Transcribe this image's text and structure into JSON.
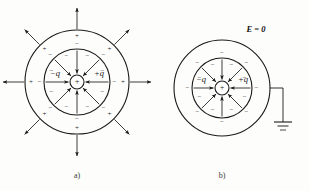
{
  "figure": {
    "background_color": "#fdfdfc",
    "ink_color": "#1a1a1a",
    "panels": [
      {
        "id": "a",
        "caption": "a)",
        "caption_x": 77,
        "caption_y": 176,
        "center_x": 77,
        "center_y": 82,
        "core_radius": 7,
        "inner_shell_radius": 33,
        "outer_shell_radius": 52,
        "grounded": false,
        "core_sign": "+",
        "inner_charge_label": "−q",
        "outer_charge_label": "+q",
        "inner_label_x": 55,
        "inner_label_y": 74,
        "outer_label_x": 99,
        "outer_label_y": 74,
        "inner_surface_sign": "−",
        "inner_shell_outer_sign": "−",
        "outer_shell_sign": "+",
        "external_field_sign": "+",
        "has_external_field": true,
        "external_arrow_length": 22,
        "spoke_count": 8,
        "sign_count_inner": 8,
        "sign_count_outer": 8
      },
      {
        "id": "b",
        "caption": "b)",
        "caption_x": 222,
        "caption_y": 176,
        "center_x": 222,
        "center_y": 88,
        "core_radius": 7,
        "inner_shell_radius": 30,
        "outer_shell_radius": 48,
        "grounded": true,
        "core_sign": "+",
        "inner_charge_label": "−q",
        "outer_charge_label": "+q",
        "inner_label_x": 201,
        "inner_label_y": 80,
        "outer_label_x": 243,
        "outer_label_y": 80,
        "inner_surface_sign": "−",
        "inner_shell_outer_sign": "−",
        "outer_shell_sign": "",
        "external_field_sign": "",
        "has_external_field": false,
        "external_arrow_length": 0,
        "spoke_count": 8,
        "sign_count_inner": 8,
        "sign_count_outer": 8,
        "field_label": "E = 0",
        "field_label_x": 256,
        "field_label_y": 30,
        "ground_wire_x": 283,
        "ground_wire_y": 88,
        "ground_stem_bottom": 122,
        "ground_bar_widths": [
          18,
          11,
          6
        ],
        "ground_bar_spacing": 4
      }
    ]
  },
  "labels": {
    "panel_a_caption": "a)",
    "panel_b_caption": "b)",
    "charge_negative": "−q",
    "charge_positive": "+q",
    "sign_plus": "+",
    "sign_minus": "−",
    "field_zero": "E = 0"
  },
  "icons": {
    "ground": "ground-symbol-icon",
    "arrow": "field-arrow-icon"
  }
}
